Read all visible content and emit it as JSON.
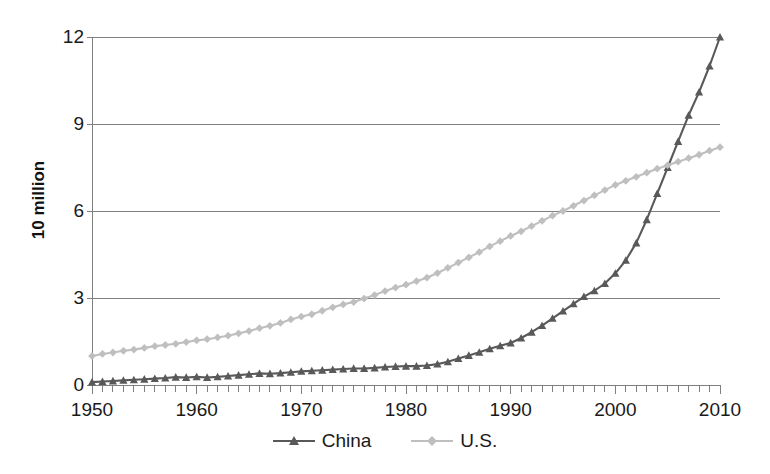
{
  "chart_data": {
    "type": "line",
    "title": "",
    "subtitle": "",
    "xlabel": "",
    "ylabel": "10 million",
    "xlim": [
      1950,
      2010
    ],
    "ylim": [
      0,
      12
    ],
    "grid": true,
    "gridlines_y": [
      0,
      3,
      6,
      9,
      12
    ],
    "legend_position": "bottom",
    "x_tick_labels": [
      "1950",
      "1960",
      "1970",
      "1980",
      "1990",
      "2000",
      "2010"
    ],
    "x_tick_values": [
      1950,
      1960,
      1970,
      1980,
      1990,
      2000,
      2010
    ],
    "x_minor_tick_interval": 1,
    "y_tick_labels": [
      "0",
      "3",
      "6",
      "9",
      "12"
    ],
    "y_tick_values": [
      0,
      3,
      6,
      9,
      12
    ],
    "x": [
      1950,
      1951,
      1952,
      1953,
      1954,
      1955,
      1956,
      1957,
      1958,
      1959,
      1960,
      1961,
      1962,
      1963,
      1964,
      1965,
      1966,
      1967,
      1968,
      1969,
      1970,
      1971,
      1972,
      1973,
      1974,
      1975,
      1976,
      1977,
      1978,
      1979,
      1980,
      1981,
      1982,
      1983,
      1984,
      1985,
      1986,
      1987,
      1988,
      1989,
      1990,
      1991,
      1992,
      1993,
      1994,
      1995,
      1996,
      1997,
      1998,
      1999,
      2000,
      2001,
      2002,
      2003,
      2004,
      2005,
      2006,
      2007,
      2008,
      2009,
      2010
    ],
    "series": [
      {
        "name": "China",
        "color": "#595959",
        "marker": "triangle",
        "values": [
          0.1,
          0.12,
          0.14,
          0.16,
          0.18,
          0.2,
          0.22,
          0.24,
          0.27,
          0.26,
          0.28,
          0.26,
          0.28,
          0.31,
          0.34,
          0.37,
          0.4,
          0.39,
          0.41,
          0.44,
          0.47,
          0.49,
          0.51,
          0.53,
          0.55,
          0.57,
          0.57,
          0.59,
          0.62,
          0.64,
          0.65,
          0.65,
          0.67,
          0.72,
          0.8,
          0.91,
          1.02,
          1.13,
          1.25,
          1.35,
          1.45,
          1.62,
          1.82,
          2.05,
          2.3,
          2.55,
          2.8,
          3.05,
          3.25,
          3.5,
          3.85,
          4.3,
          4.9,
          5.7,
          6.6,
          7.5,
          8.4,
          9.3,
          10.1,
          11.0,
          12.0
        ]
      },
      {
        "name": "U.S.",
        "color": "#bfbfbf",
        "marker": "diamond",
        "values": [
          1.0,
          1.07,
          1.12,
          1.18,
          1.22,
          1.28,
          1.34,
          1.38,
          1.42,
          1.48,
          1.54,
          1.58,
          1.64,
          1.7,
          1.78,
          1.86,
          1.96,
          2.04,
          2.14,
          2.26,
          2.36,
          2.44,
          2.56,
          2.68,
          2.78,
          2.86,
          2.98,
          3.1,
          3.24,
          3.36,
          3.46,
          3.58,
          3.7,
          3.86,
          4.04,
          4.22,
          4.4,
          4.58,
          4.78,
          4.96,
          5.14,
          5.3,
          5.48,
          5.66,
          5.84,
          6.0,
          6.18,
          6.36,
          6.54,
          6.72,
          6.9,
          7.04,
          7.18,
          7.32,
          7.46,
          7.58,
          7.7,
          7.82,
          7.94,
          8.08,
          8.2
        ]
      }
    ]
  },
  "legend": {
    "items": [
      {
        "label": "China"
      },
      {
        "label": "U.S."
      }
    ]
  },
  "axis": {
    "y_title": "10 million"
  },
  "colors": {
    "china": "#595959",
    "us": "#bfbfbf",
    "axis": "#7f7f7f",
    "grid": "#808080",
    "text": "#1a1a1a"
  }
}
